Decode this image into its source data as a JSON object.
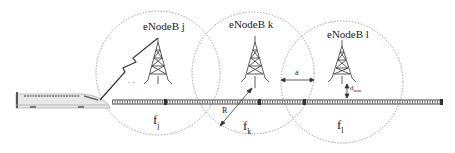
{
  "cells": [
    {
      "name": "eNodeB j",
      "freq": "f",
      "freq_sub": "j"
    },
    {
      "name": "eNodeB k",
      "freq": "f",
      "freq_sub": "k"
    },
    {
      "name": "eNodeB l",
      "freq": "f",
      "freq_sub": "l"
    }
  ],
  "annotations": {
    "radius": "R",
    "overlap": "a",
    "distance": "d",
    "distance_sub": "min"
  },
  "colors": {
    "line": "#333333",
    "circle": "#888888",
    "background": "#ffffff"
  }
}
